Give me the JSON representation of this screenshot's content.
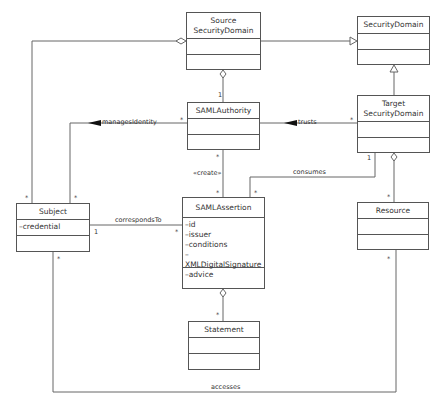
{
  "classes": {
    "source": {
      "name_line1": "Source",
      "name_line2": "SecurityDomain"
    },
    "security_domain": {
      "name": "SecurityDomain"
    },
    "saml_authority": {
      "name": "SAMLAuthority"
    },
    "target": {
      "name_line1": "Target",
      "name_line2": "SecurityDomain"
    },
    "subject": {
      "name": "Subject",
      "attributes": [
        "–credential"
      ]
    },
    "saml_assertion": {
      "name": "SAMLAssertion",
      "attributes": [
        "–id",
        "–issuer",
        "–conditions",
        "–XMLDigitalSignature",
        "–advice"
      ]
    },
    "resource": {
      "name": "Resource"
    },
    "statement": {
      "name": "Statement"
    }
  },
  "associations": {
    "manages_identity": "managesIdentity",
    "trusts": "trusts",
    "create": "«create»",
    "consumes": "consumes",
    "corresponds_to": "correspondsTo",
    "accesses": "accesses"
  },
  "multiplicities": {
    "one": "1",
    "many": "*"
  }
}
